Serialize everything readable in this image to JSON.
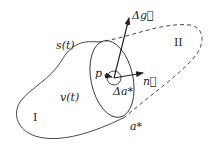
{
  "diagram": {
    "labels": {
      "surface": "s(t)",
      "volume": "v(t)",
      "region_one": "I",
      "region_two": "II",
      "point": "p",
      "area_element": "Δa*",
      "interface": "a*",
      "flux_vector": "Δg⃗",
      "normal_vector": "n⃗"
    },
    "colors": {
      "stroke": "#333333",
      "background": "#ffffff"
    }
  }
}
